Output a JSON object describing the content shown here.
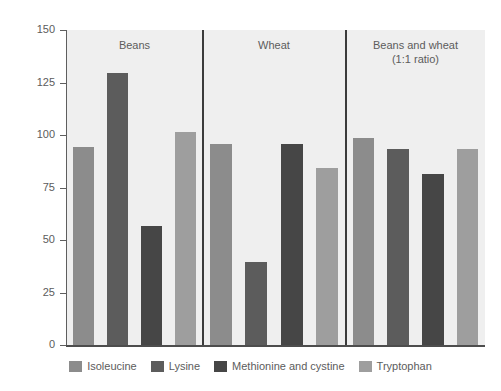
{
  "chart_data": {
    "type": "bar",
    "title": "",
    "xlabel": "",
    "ylabel": "Amount of essential amino acid (%)",
    "ylim": [
      0,
      150
    ],
    "yticks": [
      150,
      125,
      100,
      75,
      50,
      25,
      0
    ],
    "ytick_labels": [
      "150",
      "125",
      "100",
      "75",
      "50",
      "25",
      "0"
    ],
    "grid": false,
    "legend_position": "bottom",
    "categories": [
      "Beans",
      "Wheat",
      "Beans and wheat\n(1:1 ratio)"
    ],
    "panels": [
      {
        "title": "Beans",
        "title_line1": "Beans",
        "title_line2": "",
        "values": [
          95,
          130,
          57,
          102
        ]
      },
      {
        "title": "Wheat",
        "title_line1": "Wheat",
        "title_line2": "",
        "values": [
          96,
          40,
          96,
          85
        ]
      },
      {
        "title": "Beans and wheat (1:1 ratio)",
        "title_line1": "Beans and wheat",
        "title_line2": "(1:1 ratio)",
        "values": [
          99,
          94,
          82,
          94
        ]
      }
    ],
    "series": [
      {
        "name": "Isoleucine",
        "color": "#8c8c8c",
        "values": [
          95,
          96,
          99
        ]
      },
      {
        "name": "Lysine",
        "color": "#5c5c5c",
        "values": [
          130,
          40,
          94
        ]
      },
      {
        "name": "Methionine and cystine",
        "color": "#464646",
        "values": [
          57,
          96,
          82
        ]
      },
      {
        "name": "Tryptophan",
        "color": "#9e9e9e",
        "values": [
          102,
          85,
          94
        ]
      }
    ]
  },
  "legend": {
    "items": [
      {
        "label": "Isoleucine",
        "color": "#8c8c8c"
      },
      {
        "label": "Lysine",
        "color": "#5c5c5c"
      },
      {
        "label": "Methionine and cystine",
        "color": "#464646"
      },
      {
        "label": "Tryptophan",
        "color": "#9e9e9e"
      }
    ]
  },
  "style": {
    "plot_background": "#efefef",
    "axis_color": "#5e5e5e",
    "text_color": "#5c5c5c"
  }
}
